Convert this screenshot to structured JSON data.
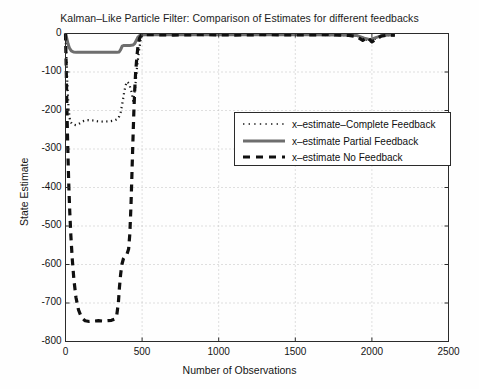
{
  "chart_data": {
    "type": "line",
    "title": "Kalman–Like Particle Filter: Comparison of Estimates for different feedbacks",
    "xlabel": "Number of Observations",
    "ylabel": "State Estimate",
    "xlim": [
      0,
      2500
    ],
    "ylim": [
      -800,
      0
    ],
    "xticks": [
      0,
      500,
      1000,
      1500,
      2000,
      2500
    ],
    "yticks": [
      0,
      -100,
      -200,
      -300,
      -400,
      -500,
      -600,
      -700,
      -800
    ],
    "xtick_labels": [
      "0",
      "500",
      "1000",
      "1500",
      "2000",
      "2500"
    ],
    "ytick_labels": [
      "0",
      "-100",
      "-200",
      "-300",
      "-400",
      "-500",
      "-600",
      "-700",
      "-800"
    ],
    "grid": true,
    "grid_style": "dotted",
    "legend_position": "center-right-upper",
    "series": [
      {
        "name": "x-estimate-Complete Feedback",
        "style": "dotted",
        "color": "#1a1a1a",
        "points": [
          [
            0,
            0
          ],
          [
            6,
            -60
          ],
          [
            12,
            -130
          ],
          [
            20,
            -195
          ],
          [
            30,
            -228
          ],
          [
            45,
            -236
          ],
          [
            70,
            -238
          ],
          [
            95,
            -233
          ],
          [
            120,
            -227
          ],
          [
            150,
            -225
          ],
          [
            180,
            -226
          ],
          [
            210,
            -228
          ],
          [
            250,
            -229
          ],
          [
            290,
            -228
          ],
          [
            320,
            -226
          ],
          [
            345,
            -221
          ],
          [
            360,
            -205
          ],
          [
            372,
            -180
          ],
          [
            382,
            -155
          ],
          [
            392,
            -135
          ],
          [
            402,
            -125
          ],
          [
            415,
            -130
          ],
          [
            430,
            -150
          ],
          [
            442,
            -175
          ],
          [
            455,
            -140
          ],
          [
            465,
            -95
          ],
          [
            478,
            -50
          ],
          [
            490,
            -18
          ],
          [
            500,
            -6
          ],
          [
            520,
            -4
          ],
          [
            560,
            -3
          ],
          [
            700,
            -3
          ],
          [
            900,
            -4
          ],
          [
            1100,
            -3
          ],
          [
            1300,
            -4
          ],
          [
            1500,
            -3
          ],
          [
            1700,
            -4
          ],
          [
            1900,
            -5
          ],
          [
            1950,
            -14
          ],
          [
            1990,
            -20
          ],
          [
            2030,
            -12
          ],
          [
            2070,
            -6
          ],
          [
            2110,
            -4
          ],
          [
            2150,
            -4
          ]
        ]
      },
      {
        "name": "x-estimate Partial Feedback",
        "style": "solid",
        "color": "#6e6e6e",
        "points": [
          [
            0,
            0
          ],
          [
            8,
            -12
          ],
          [
            16,
            -26
          ],
          [
            26,
            -38
          ],
          [
            38,
            -45
          ],
          [
            52,
            -48
          ],
          [
            70,
            -49
          ],
          [
            100,
            -49
          ],
          [
            140,
            -49
          ],
          [
            180,
            -49
          ],
          [
            220,
            -49
          ],
          [
            260,
            -49
          ],
          [
            300,
            -49
          ],
          [
            335,
            -49
          ],
          [
            350,
            -48
          ],
          [
            360,
            -42
          ],
          [
            370,
            -33
          ],
          [
            382,
            -31
          ],
          [
            400,
            -31
          ],
          [
            420,
            -31
          ],
          [
            440,
            -30
          ],
          [
            452,
            -26
          ],
          [
            462,
            -18
          ],
          [
            472,
            -10
          ],
          [
            484,
            -5
          ],
          [
            496,
            -4
          ],
          [
            520,
            -3
          ],
          [
            600,
            -3
          ],
          [
            800,
            -3
          ],
          [
            1000,
            -3
          ],
          [
            1200,
            -3
          ],
          [
            1400,
            -3
          ],
          [
            1600,
            -3
          ],
          [
            1800,
            -4
          ],
          [
            1900,
            -5
          ],
          [
            1950,
            -12
          ],
          [
            1990,
            -16
          ],
          [
            2030,
            -10
          ],
          [
            2070,
            -5
          ],
          [
            2110,
            -4
          ],
          [
            2150,
            -4
          ]
        ]
      },
      {
        "name": "x-estimate No Feedback",
        "style": "dashed",
        "color": "#101010",
        "points": [
          [
            0,
            0
          ],
          [
            5,
            -95
          ],
          [
            9,
            -190
          ],
          [
            13,
            -265
          ],
          [
            17,
            -330
          ],
          [
            22,
            -400
          ],
          [
            28,
            -465
          ],
          [
            35,
            -525
          ],
          [
            44,
            -585
          ],
          [
            55,
            -640
          ],
          [
            68,
            -685
          ],
          [
            85,
            -718
          ],
          [
            105,
            -738
          ],
          [
            128,
            -746
          ],
          [
            155,
            -748
          ],
          [
            185,
            -747
          ],
          [
            215,
            -746
          ],
          [
            245,
            -747
          ],
          [
            275,
            -746
          ],
          [
            300,
            -745
          ],
          [
            320,
            -742
          ],
          [
            335,
            -730
          ],
          [
            345,
            -700
          ],
          [
            352,
            -660
          ],
          [
            360,
            -625
          ],
          [
            368,
            -600
          ],
          [
            378,
            -585
          ],
          [
            390,
            -578
          ],
          [
            402,
            -572
          ],
          [
            412,
            -560
          ],
          [
            420,
            -520
          ],
          [
            428,
            -440
          ],
          [
            434,
            -360
          ],
          [
            440,
            -280
          ],
          [
            446,
            -205
          ],
          [
            452,
            -145
          ],
          [
            458,
            -100
          ],
          [
            466,
            -60
          ],
          [
            474,
            -30
          ],
          [
            484,
            -12
          ],
          [
            494,
            -5
          ],
          [
            510,
            -3
          ],
          [
            560,
            -3
          ],
          [
            700,
            -4
          ],
          [
            900,
            -3
          ],
          [
            1100,
            -4
          ],
          [
            1300,
            -3
          ],
          [
            1500,
            -4
          ],
          [
            1700,
            -3
          ],
          [
            1850,
            -5
          ],
          [
            1900,
            -8
          ],
          [
            1940,
            -18
          ],
          [
            1970,
            -10
          ],
          [
            2000,
            -22
          ],
          [
            2030,
            -14
          ],
          [
            2060,
            -7
          ],
          [
            2090,
            -5
          ],
          [
            2120,
            -4
          ],
          [
            2150,
            -4
          ]
        ]
      }
    ]
  },
  "legend": {
    "items": [
      {
        "label": "x–estimate–Complete Feedback",
        "style": "dotted"
      },
      {
        "label": "x–estimate Partial Feedback",
        "style": "solid"
      },
      {
        "label": "x–estimate No Feedback",
        "style": "dashed"
      }
    ]
  }
}
